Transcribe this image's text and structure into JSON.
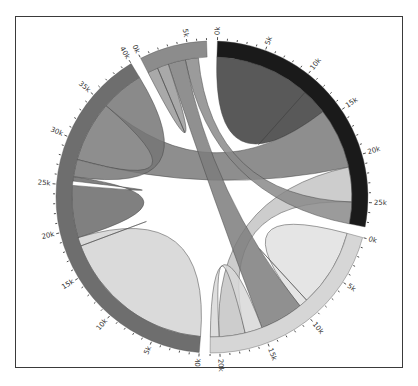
{
  "chart_data": {
    "type": "chord",
    "title": "",
    "unit": "k",
    "tick_major_step": 5,
    "tick_minor_step": 1,
    "groups": [
      {
        "name": "A",
        "color": "#1a1a1a",
        "total": 27.5,
        "tick_labels": [
          "0k",
          "5k",
          "10k",
          "15k",
          "20k",
          "25k"
        ]
      },
      {
        "name": "B",
        "color": "#d6d6d6",
        "total": 21,
        "tick_labels": [
          "0k",
          "5k",
          "10k",
          "15k",
          "20k"
        ]
      },
      {
        "name": "C",
        "color": "#6e6e6e",
        "total": 40,
        "tick_labels": [
          "0k",
          "5k",
          "10k",
          "15k",
          "20k",
          "25k",
          "30k",
          "35k",
          "40k"
        ]
      },
      {
        "name": "D",
        "color": "#8c8c8c",
        "total": 7,
        "tick_labels": [
          "0k",
          "5k"
        ]
      }
    ],
    "chords": [
      {
        "source": "A",
        "target": "A",
        "s": [
          0,
          11
        ],
        "t": [
          11,
          14
        ],
        "color": "#3c3c3c"
      },
      {
        "source": "A",
        "target": "C",
        "s": [
          14,
          21
        ],
        "t": [
          28,
          35
        ],
        "color": "#7a7a7a"
      },
      {
        "source": "A",
        "target": "B",
        "s": [
          21,
          25
        ],
        "t": [
          17,
          20
        ],
        "color": "#c4c4c4"
      },
      {
        "source": "A",
        "target": "D",
        "s": [
          25,
          27.5
        ],
        "t": [
          4.5,
          6
        ],
        "color": "#8a8a8a"
      },
      {
        "source": "B",
        "target": "B",
        "s": [
          0,
          9
        ],
        "t": [
          9,
          10
        ],
        "color": "#e0e0e0"
      },
      {
        "source": "B",
        "target": "D",
        "s": [
          10,
          15
        ],
        "t": [
          2.5,
          4.5
        ],
        "color": "#7c7c7c"
      },
      {
        "source": "B",
        "target": "B",
        "s": [
          15,
          17
        ],
        "t": [
          20,
          21
        ],
        "color": "#d8d8d8"
      },
      {
        "source": "C",
        "target": "C",
        "s": [
          0,
          18
        ],
        "t": [
          18,
          19
        ],
        "color": "#d3d3d3"
      },
      {
        "source": "C",
        "target": "C",
        "s": [
          19,
          25
        ],
        "t": [
          25.5,
          26
        ],
        "color": "#6a6a6a"
      },
      {
        "source": "C",
        "target": "C",
        "s": [
          26,
          28
        ],
        "t": [
          35,
          40
        ],
        "color": "#757575"
      },
      {
        "source": "D",
        "target": "D",
        "s": [
          0,
          1.2
        ],
        "t": [
          1.2,
          2.5
        ],
        "color": "#9a9a9a"
      }
    ],
    "layout": {
      "center": [
        212,
        197
      ],
      "inner_radius": 140,
      "outer_radius": 156,
      "gap_deg": 4,
      "start_deg": 2
    }
  }
}
